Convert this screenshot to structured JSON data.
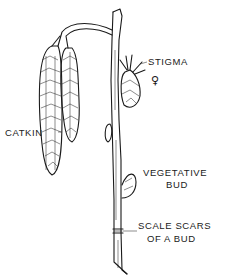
{
  "figure": {
    "labels": {
      "stigma": "STIGMA",
      "female_symbol": "♀",
      "catkin": "CATKIN",
      "vegetative_bud_line1": "VEGETATIVE",
      "vegetative_bud_line2": "BUD",
      "scale_scars_line1": "SCALE SCARS",
      "scale_scars_line2": "OF A BUD"
    },
    "colors": {
      "ink": "#1a1a1a",
      "background": "#ffffff"
    }
  }
}
